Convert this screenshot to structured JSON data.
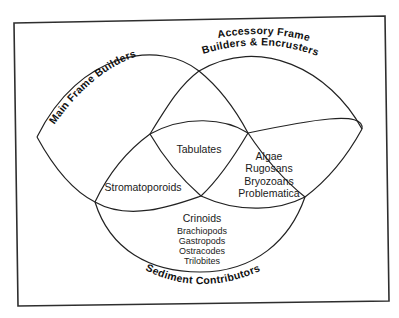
{
  "diagram": {
    "type": "venn",
    "sets": {
      "main_frame": "Main Frame Builders",
      "accessory_line1": "Accessory Frame",
      "accessory_line2": "Builders & Encrusters",
      "sediment": "Sediment Contributors"
    },
    "regions": {
      "main_and_accessory": "Tabulates",
      "main_and_sediment": "Stromatoporoids",
      "accessory_and_sediment": [
        "Algae",
        "Rugosans",
        "Bryozoans",
        "Problematica"
      ],
      "sediment_only_primary": "Crinoids",
      "sediment_only_secondary": [
        "Brachiopods",
        "Gastropods",
        "Ostracodes",
        "Trilobites"
      ]
    },
    "colors": {
      "line": "#222222",
      "text": "#111111",
      "background": "#ffffff"
    }
  }
}
